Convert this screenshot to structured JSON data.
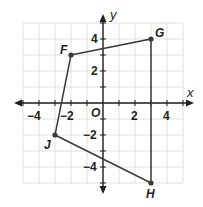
{
  "figure": {
    "type": "coordinate-plane",
    "axes": {
      "x_label": "x",
      "y_label": "y",
      "origin_label": "O",
      "range": [
        -5,
        5
      ],
      "x_tick_labels": [
        "−4",
        "−2",
        "2",
        "4"
      ],
      "y_tick_labels": [
        "4",
        "2",
        "−2",
        "−4"
      ]
    },
    "polygon": {
      "name": "FGHJ",
      "vertices": [
        {
          "label": "F",
          "x": -2,
          "y": 3
        },
        {
          "label": "G",
          "x": 3,
          "y": 4
        },
        {
          "label": "H",
          "x": 3,
          "y": -5
        },
        {
          "label": "J",
          "x": -3,
          "y": -2
        }
      ]
    },
    "colors": {
      "grid": "#d9d9d9",
      "axis": "#231f20",
      "polygon": "#3a3a3a"
    }
  }
}
